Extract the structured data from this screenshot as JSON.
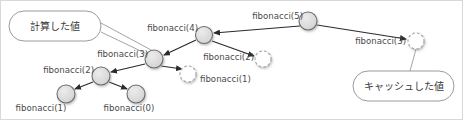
{
  "diagram": {
    "title_alt": "fibonacci recursion call tree with memoization",
    "colors": {
      "computed_fill": "#d9d9d9",
      "computed_stroke": "#6b6b6b",
      "cached_fill": "#ffffff",
      "cached_stroke": "#a8a8a8",
      "edge": "#2b2b2b",
      "callout_stroke": "#9a9a9a",
      "text": "#4a4a4a",
      "frame": "#d8d8d8",
      "background": "#ffffff"
    },
    "callouts": [
      {
        "id": "callout-computed",
        "text": "計算した値",
        "x": 8,
        "y": 10,
        "w": 92,
        "h": 30
      },
      {
        "id": "callout-cached",
        "text": "キャッシュした値",
        "x": 352,
        "y": 70,
        "w": 101,
        "h": 30
      }
    ],
    "nodes": [
      {
        "id": "fib5",
        "label": "fibonacci(5)",
        "x": 307,
        "y": 20,
        "r": 9,
        "state": "computed",
        "label_anchor": "end",
        "label_x": 302,
        "label_y": 18
      },
      {
        "id": "fib4",
        "label": "fibonacci(4)",
        "x": 203,
        "y": 34,
        "r": 8.5,
        "state": "computed",
        "label_anchor": "end",
        "label_x": 197,
        "label_y": 30
      },
      {
        "id": "fib3a",
        "label": "fibonacci(3)",
        "x": 153,
        "y": 58,
        "r": 9,
        "state": "computed",
        "label_anchor": "end",
        "label_x": 147,
        "label_y": 56
      },
      {
        "id": "fib2a",
        "label": "fibonacci(2)",
        "x": 262,
        "y": 58,
        "r": 8,
        "state": "cached",
        "label_anchor": "end",
        "label_x": 253,
        "label_y": 59
      },
      {
        "id": "fib2b",
        "label": "fibonacci(2)",
        "x": 100,
        "y": 75,
        "r": 9,
        "state": "computed",
        "label_anchor": "end",
        "label_x": 93,
        "label_y": 72
      },
      {
        "id": "fib1a",
        "label": "fibonacci(1)",
        "x": 187,
        "y": 73,
        "r": 8,
        "state": "cached",
        "label_anchor": "start",
        "label_x": 199,
        "label_y": 81
      },
      {
        "id": "fib1b",
        "label": "fibonacci(1)",
        "x": 65,
        "y": 93,
        "r": 9,
        "state": "computed",
        "label_anchor": "middle",
        "label_x": 40,
        "label_y": 110
      },
      {
        "id": "fib0",
        "label": "fibonacci(0)",
        "x": 135,
        "y": 93,
        "r": 9,
        "state": "computed",
        "label_anchor": "middle",
        "label_x": 128,
        "label_y": 110
      },
      {
        "id": "fib3b",
        "label": "fibonacci(3)",
        "x": 415,
        "y": 40,
        "r": 8,
        "state": "cached",
        "label_anchor": "end",
        "label_x": 405,
        "label_y": 43
      }
    ],
    "edges": [
      {
        "id": "edge-fib5-fib4",
        "from": "fib5",
        "to": "fib4",
        "x1": 299,
        "y1": 25,
        "x2": 213,
        "y2": 32
      },
      {
        "id": "edge-fib5-fib3b",
        "from": "fib5",
        "to": "fib3b",
        "x1": 316,
        "y1": 24,
        "x2": 405,
        "y2": 38
      },
      {
        "id": "edge-fib4-fib3a",
        "from": "fib4",
        "to": "fib3a",
        "x1": 195,
        "y1": 39,
        "x2": 163,
        "y2": 54
      },
      {
        "id": "edge-fib4-fib2a",
        "from": "fib4",
        "to": "fib2a",
        "x1": 211,
        "y1": 40,
        "x2": 253,
        "y2": 55
      },
      {
        "id": "edge-fib3a-fib2b",
        "from": "fib3a",
        "to": "fib2b",
        "x1": 144,
        "y1": 63,
        "x2": 110,
        "y2": 71
      },
      {
        "id": "edge-fib3a-fib1a",
        "from": "fib3a",
        "to": "fib1a",
        "x1": 160,
        "y1": 65,
        "x2": 181,
        "y2": 68
      },
      {
        "id": "edge-fib2b-fib1b",
        "from": "fib2b",
        "to": "fib1b",
        "x1": 92,
        "y1": 81,
        "x2": 74,
        "y2": 88
      },
      {
        "id": "edge-fib2b-fib0",
        "from": "fib2b",
        "to": "fib0",
        "x1": 108,
        "y1": 81,
        "x2": 126,
        "y2": 88
      }
    ],
    "leaders": [
      {
        "id": "leader-computed-a",
        "x1": 100,
        "y1": 22,
        "x2": 152,
        "y2": 50
      },
      {
        "id": "leader-computed-b",
        "x1": 100,
        "y1": 31,
        "x2": 148,
        "y2": 54
      },
      {
        "id": "leader-cached",
        "x1": 415,
        "y1": 48,
        "x2": 409,
        "y2": 70
      }
    ]
  }
}
